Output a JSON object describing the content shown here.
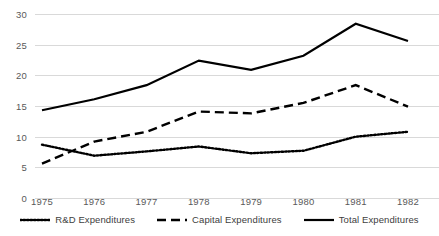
{
  "chart_data": {
    "type": "line",
    "title": "",
    "xlabel": "",
    "ylabel": "",
    "categories": [
      "1975",
      "1976",
      "1977",
      "1978",
      "1979",
      "1980",
      "1981",
      "1982"
    ],
    "ylim": [
      0,
      30
    ],
    "yticks": [
      0,
      5,
      10,
      15,
      20,
      25,
      30
    ],
    "grid": true,
    "legend_position": "bottom",
    "series": [
      {
        "name": "R&D Expenditures",
        "style": "dotted",
        "color": "#000000",
        "values": [
          8.7,
          6.9,
          7.6,
          8.4,
          7.3,
          7.7,
          10.0,
          10.8
        ]
      },
      {
        "name": "Capital Expenditures",
        "style": "dashed",
        "color": "#000000",
        "values": [
          5.6,
          9.2,
          10.8,
          14.1,
          13.8,
          15.5,
          18.4,
          14.9
        ]
      },
      {
        "name": "Total Expenditures",
        "style": "solid",
        "color": "#000000",
        "values": [
          14.3,
          16.1,
          18.4,
          22.4,
          20.9,
          23.2,
          28.4,
          25.6
        ]
      }
    ]
  },
  "axis": {
    "y_tick_labels": [
      "30",
      "25",
      "20",
      "15",
      "10",
      "5",
      "0"
    ],
    "x_tick_labels": [
      "1975",
      "1976",
      "1977",
      "1978",
      "1979",
      "1980",
      "1981",
      "1982"
    ]
  },
  "legend": {
    "items": [
      {
        "label": "R&D Expenditures",
        "key": "dotted-line-key"
      },
      {
        "label": "Capital Expenditures",
        "key": "dashed-line-key"
      },
      {
        "label": "Total Expenditures",
        "key": "solid-line-key"
      }
    ]
  }
}
